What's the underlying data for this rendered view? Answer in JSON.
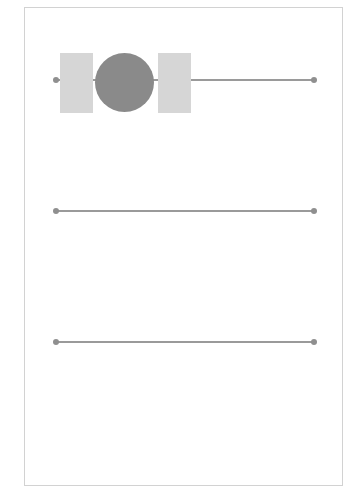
{
  "diagram": {
    "frame": {
      "border_color": "#d2d2d2"
    },
    "tracks": [
      {
        "id": "track-1",
        "y": 80,
        "x_start": 56,
        "x_end": 314,
        "has_knob": true
      },
      {
        "id": "track-2",
        "y": 211,
        "x_start": 56,
        "x_end": 314,
        "has_knob": false
      },
      {
        "id": "track-3",
        "y": 342,
        "x_start": 56,
        "x_end": 314,
        "has_knob": false
      }
    ],
    "knob": {
      "color": "#8a8a8a",
      "cx": 124,
      "cy": 82,
      "r": 29
    },
    "blocks": [
      {
        "id": "left-block",
        "x": 60,
        "y": 53,
        "w": 33,
        "h": 60,
        "color": "#d6d6d6"
      },
      {
        "id": "right-block",
        "x": 158,
        "y": 53,
        "w": 33,
        "h": 60,
        "color": "#d6d6d6"
      }
    ],
    "colors": {
      "track": "#9a9a9a",
      "endpoint": "#8f8f8f"
    }
  }
}
